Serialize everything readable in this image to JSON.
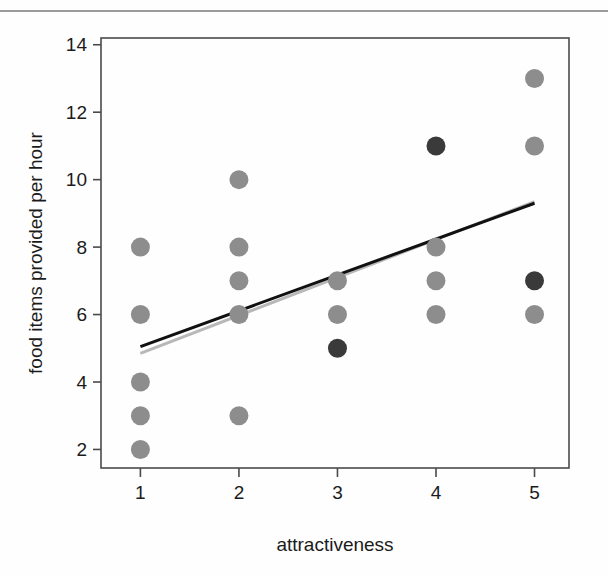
{
  "chart_data": {
    "type": "scatter",
    "title": "",
    "xlabel": "attractiveness",
    "ylabel": "food items provided per hour",
    "xlim": [
      0.6,
      5.35
    ],
    "ylim": [
      1.45,
      14.2
    ],
    "xticks": [
      1,
      2,
      3,
      4,
      5
    ],
    "xtick_labels": [
      "1",
      "2",
      "3",
      "4",
      "5"
    ],
    "yticks": [
      2,
      4,
      6,
      8,
      10,
      12,
      14
    ],
    "ytick_labels": [
      "2",
      "4",
      "6",
      "8",
      "10",
      "12",
      "14"
    ],
    "grid": false,
    "legend": "none",
    "frame": "box",
    "series": [
      {
        "name": "observations",
        "marker": "filled-circle",
        "color": "#8d8d8d",
        "points": [
          {
            "x": 1,
            "y": 8
          },
          {
            "x": 1,
            "y": 6
          },
          {
            "x": 1,
            "y": 4
          },
          {
            "x": 1,
            "y": 3
          },
          {
            "x": 1,
            "y": 2
          },
          {
            "x": 2,
            "y": 10
          },
          {
            "x": 2,
            "y": 8
          },
          {
            "x": 2,
            "y": 7
          },
          {
            "x": 2,
            "y": 6
          },
          {
            "x": 2,
            "y": 3
          },
          {
            "x": 3,
            "y": 7
          },
          {
            "x": 3,
            "y": 6
          },
          {
            "x": 4,
            "y": 8
          },
          {
            "x": 4,
            "y": 7
          },
          {
            "x": 4,
            "y": 6
          },
          {
            "x": 5,
            "y": 13
          },
          {
            "x": 5,
            "y": 11
          },
          {
            "x": 5,
            "y": 6
          }
        ]
      },
      {
        "name": "overlapping observations",
        "marker": "filled-circle",
        "color": "#3a3a3a",
        "points": [
          {
            "x": 3,
            "y": 5
          },
          {
            "x": 4,
            "y": 11
          },
          {
            "x": 5,
            "y": 7
          }
        ]
      }
    ],
    "lines": [
      {
        "name": "fitted regression line",
        "color": "#111111",
        "width": 3,
        "x": [
          1,
          5
        ],
        "y": [
          5.05,
          9.3
        ]
      },
      {
        "name": "secondary fitted line",
        "color": "#b8b8b8",
        "width": 3,
        "x": [
          1,
          5
        ],
        "y": [
          4.85,
          9.35
        ]
      }
    ]
  },
  "axes": {
    "x_axis_title": "attractiveness",
    "y_axis_title": "food items provided per hour"
  },
  "colors": {
    "point_light": "#8d8d8d",
    "point_dark": "#3a3a3a",
    "line_black": "#111111",
    "line_grey": "#b8b8b8",
    "frame": "#4a4a4a",
    "text": "#1b1b1b",
    "top_rule": "#9a9a9a"
  }
}
